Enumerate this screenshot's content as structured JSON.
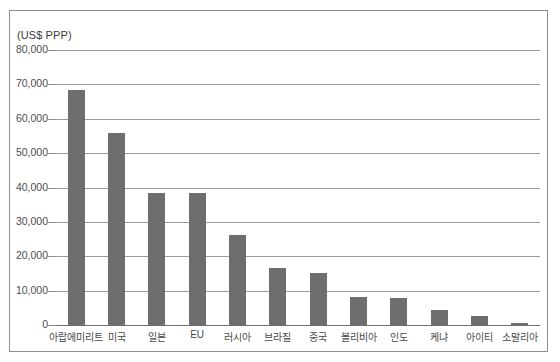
{
  "chart_data": {
    "type": "bar",
    "title": "",
    "subtitle": "",
    "xlabel": "",
    "ylabel": "(US$ PPP)",
    "unit_caption": "(US$ PPP)",
    "ylim": [
      0,
      80000
    ],
    "ytick_step": 10000,
    "ytick_labels": [
      "80,000",
      "70,000",
      "60,000",
      "50,000",
      "40,000",
      "30,000",
      "20,000",
      "10,000",
      "0"
    ],
    "ytick_values": [
      80000,
      70000,
      60000,
      50000,
      40000,
      30000,
      20000,
      10000,
      0
    ],
    "grid": true,
    "legend": "none",
    "bar_color": "#6e6e6e",
    "categories": [
      "아랍에미리트",
      "미국",
      "일본",
      "EU",
      "러시아",
      "브라질",
      "중국",
      "볼리비아",
      "인도",
      "케냐",
      "아이티",
      "소말리아"
    ],
    "values": [
      68300,
      56000,
      38400,
      38300,
      26200,
      16500,
      15000,
      8200,
      8000,
      4400,
      2700,
      700
    ],
    "series": [
      {
        "name": "1인당 국민소득",
        "values": [
          68300,
          56000,
          38400,
          38300,
          26200,
          16500,
          15000,
          8200,
          8000,
          4400,
          2700,
          700
        ]
      }
    ]
  },
  "frame": {
    "border_color": "#8d8d8d"
  }
}
